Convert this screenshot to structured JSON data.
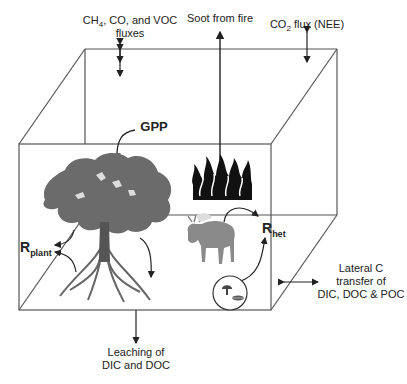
{
  "diagram": {
    "labels": {
      "ch4_flux": {
        "line1_pre": "CH",
        "line1_sub": "4",
        "line1_post": ", CO, and VOC",
        "line2": "fluxes"
      },
      "soot": "Soot from fire",
      "co2_flux": {
        "pre": "CO",
        "sub": "2",
        "post": " flux (NEE)"
      },
      "gpp": "GPP",
      "r_plant": {
        "main": "R",
        "sub": "plant"
      },
      "r_het": {
        "main": "R",
        "sub": "het"
      },
      "lateral": {
        "line1": "Lateral C",
        "line2": "transfer of",
        "line3": "DIC, DOC & POC"
      },
      "leaching": {
        "line1": "Leaching of",
        "line2": "DIC and DOC"
      }
    },
    "icons": [
      "tree-icon",
      "fire-icon",
      "moose-icon",
      "mushroom-icon",
      "leaf-litter-icon"
    ],
    "colors": {
      "line": "#333333",
      "tree": "#6b6b6b",
      "tree_dark": "#4a4a4a",
      "fire": "#111111",
      "moose": "#8a8a8a"
    }
  }
}
